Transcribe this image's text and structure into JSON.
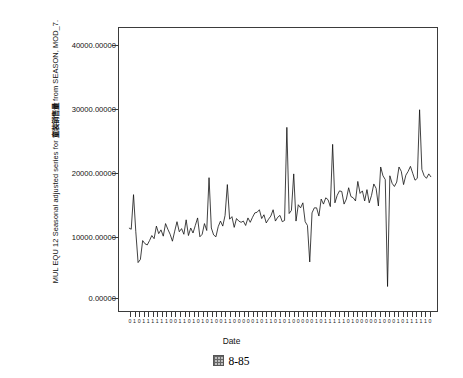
{
  "figure": {
    "caption": "8-85",
    "caption_icon": "chinese-tu-character-glyph"
  },
  "chart_data": {
    "type": "line",
    "title": "",
    "ylabel_parts": {
      "prefix": "MUL EQU 12 Seasonal adjusted series for ",
      "cjk": "童装销售量",
      "suffix": " from SEASON, MOD_7."
    },
    "ylabel": "MUL EQU 12 Seasonal adjusted series for 童装销售量 from SEASON, MOD_7.",
    "xlabel": "Date",
    "ylim": [
      0,
      45000
    ],
    "ytick_labels": [
      "40000.00000",
      "30000.00000",
      "20000.00000",
      "10000.00000",
      "0.00000"
    ],
    "ytick_values": [
      40000,
      30000,
      20000,
      10000,
      0
    ],
    "grid": false,
    "legend": "none",
    "xtick_labels": [
      "0",
      "1",
      "0",
      "1",
      "1",
      "1",
      "1",
      "1",
      "1",
      "0",
      "0",
      "1",
      "1",
      "0",
      "1",
      "0",
      "1",
      "0",
      "1",
      "0",
      "0",
      "1",
      "1",
      "0",
      "0",
      "0",
      "0",
      "0",
      "1",
      "0",
      "1",
      "1",
      "0",
      "1",
      "0",
      "1",
      "0",
      "0",
      "0",
      "0",
      "0",
      "1",
      "0",
      "1",
      "1",
      "1",
      "1",
      "1",
      "0",
      "1",
      "0",
      "0",
      "0",
      "0",
      "0",
      "1",
      "0",
      "0",
      "0",
      "1",
      "0",
      "1",
      "1",
      "1",
      "1",
      "1",
      "0"
    ],
    "x": [
      1,
      2,
      3,
      4,
      5,
      6,
      7,
      8,
      9,
      10,
      11,
      12,
      13,
      14,
      15,
      16,
      17,
      18,
      19,
      20,
      21,
      22,
      23,
      24,
      25,
      26,
      27,
      28,
      29,
      30,
      31,
      32,
      33,
      34,
      35,
      36,
      37,
      38,
      39,
      40,
      41,
      42,
      43,
      44,
      45,
      46,
      47,
      48,
      49,
      50,
      51,
      52,
      53,
      54,
      55,
      56,
      57,
      58,
      59,
      60,
      61,
      62,
      63,
      64,
      65,
      66,
      67,
      68,
      69,
      70,
      71,
      72,
      73,
      74,
      75,
      76,
      77,
      78,
      79,
      80,
      81,
      82,
      83,
      84,
      85,
      86,
      87,
      88,
      89,
      90,
      91,
      92,
      93,
      94,
      95,
      96,
      97,
      98,
      99,
      100,
      101,
      102,
      103,
      104,
      105,
      106,
      107,
      108,
      109,
      110,
      111,
      112,
      113,
      114,
      115,
      116,
      117,
      118,
      119,
      120,
      121,
      122,
      123,
      124,
      125,
      126,
      127,
      128,
      129,
      130,
      131,
      132,
      133
    ],
    "values": [
      13200,
      13000,
      18500,
      12600,
      7700,
      8200,
      11200,
      10700,
      10500,
      11200,
      12000,
      11500,
      13500,
      12300,
      12900,
      11900,
      13900,
      13000,
      12200,
      11100,
      12700,
      14200,
      12600,
      13100,
      12200,
      14500,
      12000,
      13200,
      12400,
      13600,
      14800,
      11800,
      12200,
      13900,
      12800,
      21200,
      13200,
      12100,
      11800,
      13400,
      14300,
      13500,
      15200,
      20100,
      14600,
      15000,
      13300,
      14700,
      14300,
      14100,
      14300,
      13600,
      14800,
      14100,
      14900,
      15600,
      15700,
      16100,
      14700,
      15300,
      14000,
      14600,
      15100,
      16100,
      14300,
      14900,
      15200,
      14200,
      14400,
      29200,
      15500,
      16000,
      21800,
      14300,
      16900,
      16400,
      17200,
      14200,
      13600,
      7800,
      15600,
      16400,
      16400,
      15100,
      17800,
      17000,
      18000,
      17700,
      16600,
      26500,
      17200,
      18400,
      19100,
      19000,
      17000,
      17800,
      19600,
      18200,
      18000,
      17500,
      20600,
      18700,
      19100,
      17500,
      19300,
      17200,
      18400,
      20200,
      19500,
      16700,
      22900,
      21500,
      20900,
      3900,
      21500,
      20300,
      19800,
      20500,
      22900,
      22200,
      20100,
      21600,
      22200,
      23000,
      21900,
      20800,
      21100,
      32000,
      22500,
      21500,
      21100,
      21800,
      21300
    ],
    "line_color": "#111111",
    "x_axis_tick_count": 67
  }
}
